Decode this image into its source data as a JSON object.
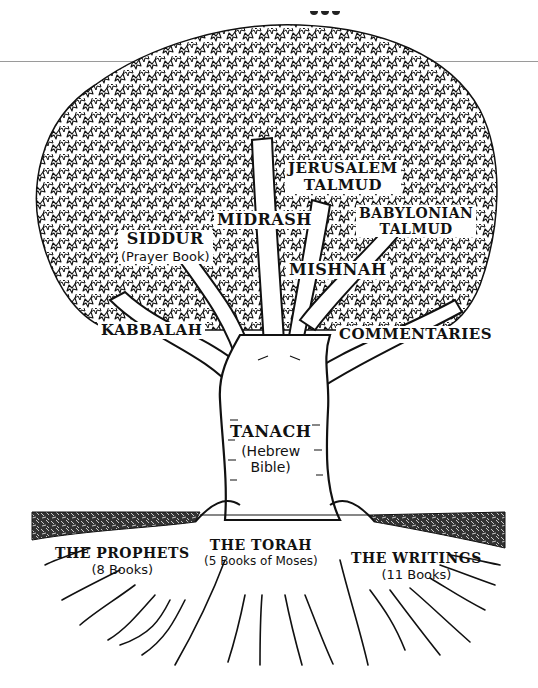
{
  "diagram": {
    "type": "tree",
    "colors": {
      "ink": "#111111",
      "paper": "#ffffff",
      "rule": "#9a9a9a"
    },
    "canopy_labels": {
      "jerusalem_talmud": {
        "line1": "JERUSALEM",
        "line2": "TALMUD"
      },
      "babylonian_talmud": {
        "line1": "BABYLONIAN",
        "line2": "TALMUD"
      },
      "midrash": {
        "title": "MIDRASH"
      },
      "siddur": {
        "title": "SIDDUR",
        "subtitle": "(Prayer Book)"
      },
      "mishnah": {
        "title": "MISHNAH"
      }
    },
    "branch_labels": {
      "kabbalah": {
        "title": "KABBALAH"
      },
      "commentaries": {
        "title": "COMMENTARIES"
      }
    },
    "trunk_label": {
      "title": "TANACH",
      "subtitle_line1": "(Hebrew",
      "subtitle_line2": "Bible)"
    },
    "root_labels": {
      "prophets": {
        "title": "THE PROPHETS",
        "subtitle": "(8 Books)"
      },
      "torah": {
        "title": "THE TORAH",
        "subtitle": "(5 Books of Moses)"
      },
      "writings": {
        "title": "THE WRITINGS",
        "subtitle": "(11 Books)"
      }
    }
  }
}
